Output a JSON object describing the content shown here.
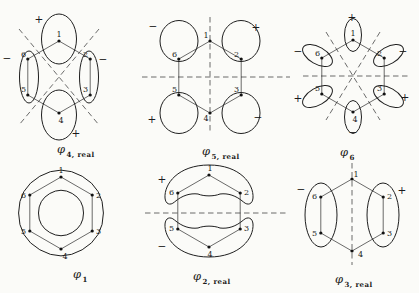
{
  "figure": {
    "background": "#fbfbf8",
    "ink": "#1b1b1b",
    "dash_color": "#5a5a5a",
    "panels": [
      {
        "name": "phi-4-real",
        "symbol": "φ",
        "subscript": "4, real",
        "atoms": [
          "1",
          "2",
          "3",
          "4",
          "5",
          "6"
        ],
        "signs": [
          "+",
          "−",
          "−",
          "+"
        ]
      },
      {
        "name": "phi-5-real",
        "symbol": "φ",
        "subscript": "5, real",
        "atoms": [
          "1",
          "2",
          "3",
          "4",
          "5",
          "6"
        ],
        "signs": [
          "−",
          "+",
          "+",
          "−"
        ]
      },
      {
        "name": "phi-6",
        "symbol": "φ",
        "subscript": "6",
        "atoms": [
          "1",
          "2",
          "3",
          "4",
          "5",
          "6"
        ],
        "signs": [
          "+",
          "−",
          "+",
          "−",
          "+",
          "−"
        ]
      },
      {
        "name": "phi-1",
        "symbol": "φ",
        "subscript": "1",
        "atoms": [
          "1",
          "2",
          "3",
          "4",
          "5",
          "6"
        ],
        "signs": []
      },
      {
        "name": "phi-2-real",
        "symbol": "φ",
        "subscript": "2, real",
        "atoms": [
          "1",
          "2",
          "3",
          "4",
          "5",
          "6"
        ],
        "signs": [
          "+",
          "−"
        ]
      },
      {
        "name": "phi-3-real",
        "symbol": "φ",
        "subscript": "3, real",
        "atoms": [
          "1",
          "2",
          "3",
          "4",
          "5",
          "6"
        ],
        "signs": [
          "−",
          "+"
        ]
      }
    ]
  }
}
